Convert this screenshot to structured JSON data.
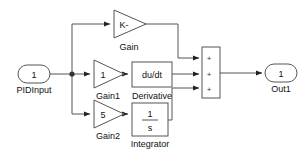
{
  "diagram": {
    "type": "simulink-block-diagram",
    "background_color": "#ffffff",
    "line_color": "#555555",
    "text_color": "#111111"
  },
  "ports": {
    "input": {
      "number": "1",
      "label": "PIDInput"
    },
    "output": {
      "number": "1",
      "label": "Out1"
    }
  },
  "blocks": {
    "gain": {
      "value": "K-",
      "label": "Gain",
      "shape": "triangle"
    },
    "gain1": {
      "value": "1",
      "label": "Gain1",
      "shape": "triangle"
    },
    "gain2": {
      "value": "5",
      "label": "Gain2",
      "shape": "triangle"
    },
    "derivative": {
      "value": "du/dt",
      "label": "Derivative",
      "shape": "rectangle"
    },
    "integrator": {
      "numerator": "1",
      "denominator": "s",
      "label": "Integrator",
      "shape": "rectangle"
    },
    "sum": {
      "label": "",
      "shape": "rectangle",
      "signs": [
        "+",
        "+",
        "+"
      ]
    }
  }
}
